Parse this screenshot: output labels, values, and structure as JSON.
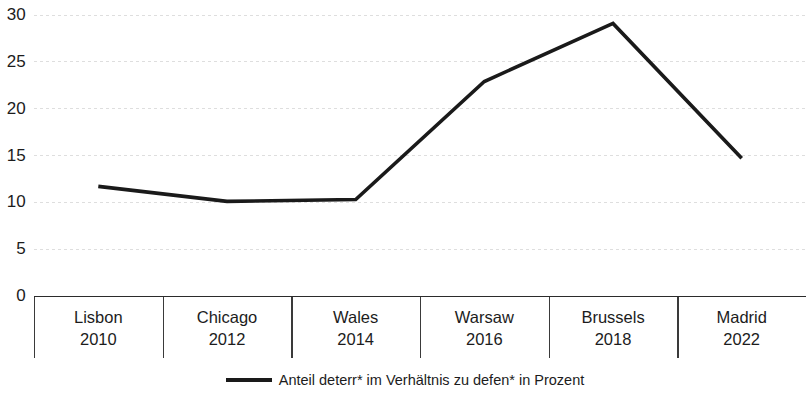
{
  "chart_data": {
    "type": "line",
    "title": "",
    "subtitle": "",
    "xlabel": "",
    "ylabel": "",
    "categories": [
      "Lisbon 2010",
      "Chicago 2012",
      "Wales 2014",
      "Warsaw 2016",
      "Brussels 2018",
      "Madrid 2022"
    ],
    "category_names": [
      "Lisbon",
      "Chicago",
      "Wales",
      "Warsaw",
      "Brussels",
      "Madrid"
    ],
    "category_years": [
      "2010",
      "2012",
      "2014",
      "2016",
      "2018",
      "2022"
    ],
    "series": [
      {
        "name": "Anteil deterr* im Verhältnis zu defen* in Prozent",
        "values": [
          11.7,
          10.1,
          10.3,
          22.9,
          29.1,
          14.7
        ],
        "color": "#1a1a1a"
      }
    ],
    "ylim": [
      0,
      30
    ],
    "yticks": [
      0,
      5,
      10,
      15,
      20,
      25,
      30
    ],
    "ytick_labels": [
      "0",
      "5",
      "10",
      "15",
      "20",
      "25",
      "30"
    ],
    "grid": true,
    "grid_style": "dotted-horizontal",
    "grid_color": "#dcdcdc",
    "legend_position": "bottom-center",
    "legend_entries": [
      "Anteil deterr* im Verhältnis zu defen* in Prozent"
    ]
  },
  "axis": {
    "y_ticks": [
      "30",
      "25",
      "20",
      "15",
      "10",
      "5",
      "0"
    ],
    "x_categories": [
      {
        "name": "Lisbon",
        "year": "2010"
      },
      {
        "name": "Chicago",
        "year": "2012"
      },
      {
        "name": "Wales",
        "year": "2014"
      },
      {
        "name": "Warsaw",
        "year": "2016"
      },
      {
        "name": "Brussels",
        "year": "2018"
      },
      {
        "name": "Madrid",
        "year": "2022"
      }
    ]
  },
  "legend": {
    "label": "Anteil deterr* im Verhältnis zu defen* in Prozent"
  },
  "colors": {
    "line": "#1a1a1a",
    "grid": "#dcdcdc",
    "axis": "#3a3a3a",
    "text": "#1c1c1c",
    "background": "#ffffff"
  }
}
